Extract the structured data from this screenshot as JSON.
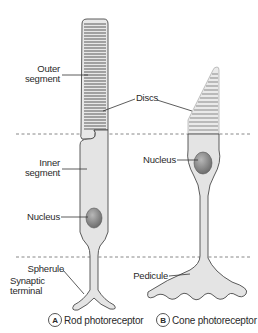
{
  "labels": {
    "outer_segment": [
      "Outer",
      "segment"
    ],
    "inner_segment": [
      "Inner",
      "segment"
    ],
    "discs": "Discs",
    "nucleus_rod": "Nucleus",
    "nucleus_cone": "Nucleus",
    "spherule": "Spherule",
    "synaptic_terminal": [
      "Synaptic",
      "terminal"
    ],
    "pedicule": "Pedicule"
  },
  "captions": {
    "rod": {
      "badge": "A",
      "text": "Rod photoreceptor"
    },
    "cone": {
      "badge": "B",
      "text": "Cone photoreceptor"
    }
  },
  "colors": {
    "cell_fill": "#e4e4e4",
    "cell_stroke": "#4a4a4a",
    "disc": "#7a7a7a",
    "nucleus": "#8a8a8a",
    "dashed_line": "#6a6a6a",
    "text": "#2a2a2a"
  }
}
